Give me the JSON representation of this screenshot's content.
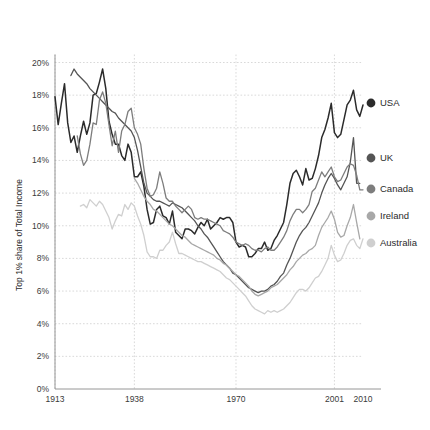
{
  "chart_data": {
    "type": "line",
    "title": "",
    "xlabel": "",
    "ylabel": "Top 1% share of Total Income",
    "xlim": [
      1913,
      2010
    ],
    "ylim": [
      0,
      20
    ],
    "grid": true,
    "legend_position": "right",
    "y_ticks": [
      "0%",
      "2%",
      "4%",
      "6%",
      "8%",
      "10%",
      "12%",
      "14%",
      "16%",
      "18%",
      "20%"
    ],
    "y_tick_values": [
      0,
      2,
      4,
      6,
      8,
      10,
      12,
      14,
      16,
      18,
      20
    ],
    "x_ticks": [
      "1913",
      "1938",
      "1970",
      "2001",
      "2010"
    ],
    "x_tick_values": [
      1913,
      1938,
      1970,
      2001,
      2010
    ],
    "x_gridlines": [
      1913,
      1938,
      1970,
      2001
    ],
    "colors": {
      "USA": "#2b2b2b",
      "UK": "#555555",
      "Canada": "#7d7d7d",
      "Ireland": "#a8a8a8",
      "Australia": "#cfcfcf"
    },
    "series": [
      {
        "name": "USA",
        "color": "#2b2b2b",
        "x": [
          1913,
          1914,
          1915,
          1916,
          1917,
          1918,
          1919,
          1920,
          1921,
          1922,
          1923,
          1924,
          1925,
          1926,
          1927,
          1928,
          1929,
          1930,
          1931,
          1932,
          1933,
          1934,
          1935,
          1936,
          1937,
          1938,
          1939,
          1940,
          1941,
          1942,
          1943,
          1944,
          1945,
          1946,
          1947,
          1948,
          1949,
          1950,
          1951,
          1952,
          1953,
          1954,
          1955,
          1956,
          1957,
          1958,
          1959,
          1960,
          1961,
          1962,
          1963,
          1964,
          1965,
          1966,
          1967,
          1968,
          1969,
          1970,
          1971,
          1972,
          1973,
          1974,
          1975,
          1976,
          1977,
          1978,
          1979,
          1980,
          1981,
          1982,
          1983,
          1984,
          1985,
          1986,
          1987,
          1988,
          1989,
          1990,
          1991,
          1992,
          1993,
          1994,
          1995,
          1996,
          1997,
          1998,
          1999,
          2000,
          2001,
          2002,
          2003,
          2004,
          2005,
          2006,
          2007,
          2008,
          2009,
          2010
        ],
        "y": [
          17.9,
          16.2,
          17.5,
          18.7,
          16.3,
          15.1,
          15.5,
          14.5,
          15.5,
          16.4,
          15.6,
          16.3,
          18.0,
          18.1,
          18.8,
          19.6,
          18.4,
          16.4,
          15.6,
          15.0,
          15.0,
          14.3,
          14.0,
          15.0,
          14.5,
          13.0,
          13.0,
          13.3,
          12.4,
          11.0,
          10.1,
          10.2,
          11.0,
          11.2,
          10.6,
          10.5,
          10.1,
          10.9,
          9.6,
          9.4,
          9.2,
          9.8,
          9.8,
          9.7,
          9.5,
          9.9,
          10.2,
          10.0,
          10.4,
          9.8,
          10.0,
          10.2,
          10.5,
          10.4,
          10.5,
          10.5,
          10.2,
          9.0,
          8.7,
          8.8,
          8.7,
          8.1,
          8.1,
          8.3,
          8.6,
          8.6,
          9.0,
          8.5,
          8.6,
          9.1,
          9.4,
          9.8,
          10.2,
          11.3,
          12.6,
          13.2,
          13.4,
          13.0,
          12.5,
          13.5,
          12.8,
          12.9,
          13.5,
          14.3,
          15.4,
          15.9,
          16.6,
          17.5,
          15.7,
          15.4,
          15.6,
          16.5,
          17.4,
          17.7,
          18.3,
          17.1,
          16.7,
          17.4
        ]
      },
      {
        "name": "UK",
        "color": "#555555",
        "x": [
          1918,
          1919,
          1920,
          1921,
          1922,
          1923,
          1924,
          1925,
          1926,
          1927,
          1928,
          1929,
          1930,
          1931,
          1932,
          1933,
          1934,
          1935,
          1936,
          1937,
          1938,
          1939,
          1940,
          1941,
          1942,
          1943,
          1944,
          1945,
          1946,
          1947,
          1948,
          1949,
          1950,
          1951,
          1952,
          1953,
          1954,
          1955,
          1956,
          1957,
          1958,
          1959,
          1960,
          1961,
          1962,
          1963,
          1964,
          1965,
          1966,
          1967,
          1968,
          1969,
          1970,
          1971,
          1972,
          1973,
          1974,
          1975,
          1976,
          1977,
          1978,
          1979,
          1980,
          1981,
          1982,
          1983,
          1984,
          1985,
          1986,
          1987,
          1988,
          1989,
          1990,
          1991,
          1992,
          1993,
          1994,
          1995,
          1996,
          1997,
          1998,
          1999,
          2000,
          2001,
          2002,
          2003,
          2004,
          2005,
          2006,
          2007,
          2008,
          2009
        ],
        "y": [
          19.2,
          19.6,
          19.3,
          19.1,
          18.9,
          18.7,
          18.4,
          18.2,
          18.0,
          17.8,
          17.6,
          17.4,
          17.2,
          17.0,
          16.9,
          16.6,
          16.4,
          16.2,
          16.0,
          15.8,
          15.4,
          14.6,
          13.6,
          12.6,
          12.0,
          11.8,
          11.6,
          11.5,
          11.5,
          11.4,
          11.3,
          11.2,
          11.4,
          11.3,
          11.2,
          11.1,
          10.9,
          10.7,
          10.5,
          10.3,
          10.0,
          9.8,
          9.5,
          9.3,
          9.0,
          8.7,
          8.4,
          8.1,
          7.8,
          7.6,
          7.4,
          7.1,
          7.0,
          6.8,
          6.6,
          6.4,
          6.2,
          6.1,
          6.0,
          5.9,
          6.0,
          6.0,
          6.1,
          6.3,
          6.4,
          6.6,
          6.9,
          7.1,
          7.6,
          8.0,
          8.5,
          9.0,
          9.4,
          9.7,
          9.9,
          10.2,
          10.6,
          11.0,
          11.4,
          12.0,
          12.5,
          12.9,
          13.2,
          12.9,
          12.5,
          12.2,
          12.6,
          13.0,
          13.9,
          15.4,
          12.6,
          12.6
        ]
      },
      {
        "name": "Canada",
        "color": "#7d7d7d",
        "x": [
          1920,
          1921,
          1922,
          1923,
          1924,
          1925,
          1926,
          1927,
          1928,
          1929,
          1930,
          1931,
          1932,
          1933,
          1934,
          1935,
          1936,
          1937,
          1938,
          1939,
          1940,
          1941,
          1942,
          1943,
          1944,
          1945,
          1946,
          1947,
          1948,
          1949,
          1950,
          1951,
          1952,
          1953,
          1954,
          1955,
          1956,
          1957,
          1958,
          1959,
          1960,
          1961,
          1962,
          1963,
          1964,
          1965,
          1966,
          1967,
          1968,
          1969,
          1970,
          1971,
          1972,
          1973,
          1974,
          1975,
          1976,
          1977,
          1978,
          1979,
          1980,
          1981,
          1982,
          1983,
          1984,
          1985,
          1986,
          1987,
          1988,
          1989,
          1990,
          1991,
          1992,
          1993,
          1994,
          1995,
          1996,
          1997,
          1998,
          1999,
          2000,
          2001,
          2002,
          2003,
          2004,
          2005,
          2006,
          2007,
          2008,
          2009,
          2010
        ],
        "y": [
          15.5,
          14.4,
          13.7,
          14.0,
          15.0,
          16.3,
          16.2,
          17.7,
          18.2,
          17.5,
          16.2,
          14.9,
          15.8,
          14.5,
          15.8,
          16.2,
          17.0,
          17.2,
          16.0,
          15.6,
          15.0,
          13.5,
          12.3,
          11.8,
          11.9,
          12.3,
          13.3,
          12.6,
          11.7,
          11.5,
          11.5,
          11.2,
          11.0,
          10.8,
          11.0,
          11.2,
          11.0,
          10.5,
          10.4,
          10.5,
          10.4,
          10.4,
          10.3,
          10.2,
          10.1,
          10.0,
          9.7,
          9.6,
          9.5,
          9.3,
          9.0,
          8.9,
          8.8,
          8.9,
          8.8,
          8.6,
          8.5,
          8.5,
          8.4,
          8.6,
          8.7,
          8.5,
          8.5,
          8.7,
          9.0,
          9.3,
          9.7,
          10.3,
          10.7,
          11.0,
          11.0,
          10.8,
          11.0,
          11.3,
          12.1,
          12.3,
          12.8,
          13.3,
          13.0,
          13.3,
          13.6,
          13.0,
          12.7,
          12.8,
          13.2,
          13.6,
          13.8,
          13.7,
          13.1,
          12.2,
          12.2
        ]
      },
      {
        "name": "Ireland",
        "color": "#a8a8a8",
        "x": [
          1938,
          1939,
          1940,
          1941,
          1942,
          1943,
          1944,
          1945,
          1946,
          1947,
          1948,
          1949,
          1950,
          1951,
          1952,
          1953,
          1954,
          1955,
          1956,
          1957,
          1958,
          1959,
          1960,
          1961,
          1962,
          1963,
          1964,
          1965,
          1966,
          1967,
          1968,
          1969,
          1970,
          1971,
          1972,
          1973,
          1974,
          1975,
          1976,
          1977,
          1978,
          1979,
          1980,
          1981,
          1982,
          1983,
          1984,
          1985,
          1986,
          1987,
          1988,
          1989,
          1990,
          1991,
          1992,
          1993,
          1994,
          1995,
          1996,
          1997,
          1998,
          1999,
          2000,
          2001,
          2002,
          2003,
          2004,
          2005,
          2006,
          2007,
          2008,
          2009
        ],
        "y": [
          12.9,
          12.6,
          12.2,
          11.8,
          11.5,
          11.3,
          11.0,
          10.9,
          10.7,
          10.5,
          10.3,
          10.1,
          10.0,
          9.8,
          9.6,
          9.4,
          9.3,
          9.1,
          8.9,
          8.8,
          8.7,
          8.6,
          8.5,
          8.4,
          8.3,
          8.2,
          8.0,
          7.9,
          7.7,
          7.6,
          7.4,
          7.2,
          7.0,
          6.9,
          6.7,
          6.5,
          6.3,
          6.0,
          5.8,
          5.7,
          5.8,
          5.9,
          6.0,
          6.2,
          6.3,
          6.4,
          6.6,
          6.8,
          7.0,
          7.3,
          7.5,
          7.8,
          8.0,
          8.2,
          8.3,
          8.5,
          8.6,
          8.8,
          9.4,
          9.9,
          10.2,
          10.5,
          10.9,
          10.4,
          9.6,
          9.3,
          9.4,
          10.0,
          10.5,
          11.3,
          10.2,
          9.2
        ]
      },
      {
        "name": "Australia",
        "color": "#cfcfcf",
        "x": [
          1921,
          1922,
          1923,
          1924,
          1925,
          1926,
          1927,
          1928,
          1929,
          1930,
          1931,
          1932,
          1933,
          1934,
          1935,
          1936,
          1937,
          1938,
          1939,
          1940,
          1941,
          1942,
          1943,
          1944,
          1945,
          1946,
          1947,
          1948,
          1949,
          1950,
          1951,
          1952,
          1953,
          1954,
          1955,
          1956,
          1957,
          1958,
          1959,
          1960,
          1961,
          1962,
          1963,
          1964,
          1965,
          1966,
          1967,
          1968,
          1969,
          1970,
          1971,
          1972,
          1973,
          1974,
          1975,
          1976,
          1977,
          1978,
          1979,
          1980,
          1981,
          1982,
          1983,
          1984,
          1985,
          1986,
          1987,
          1988,
          1989,
          1990,
          1991,
          1992,
          1993,
          1994,
          1995,
          1996,
          1997,
          1998,
          1999,
          2000,
          2001,
          2002,
          2003,
          2004,
          2005,
          2006,
          2007,
          2008,
          2009,
          2010
        ],
        "y": [
          11.2,
          11.3,
          11.1,
          11.6,
          11.4,
          11.2,
          11.5,
          11.3,
          10.9,
          10.5,
          9.8,
          10.3,
          10.7,
          10.6,
          11.3,
          11.0,
          11.4,
          11.2,
          10.6,
          10.1,
          9.4,
          8.4,
          8.1,
          8.1,
          8.0,
          8.5,
          8.5,
          8.8,
          9.0,
          9.6,
          8.9,
          8.3,
          8.3,
          8.2,
          8.1,
          8.0,
          7.9,
          7.8,
          7.8,
          7.7,
          7.6,
          7.5,
          7.4,
          7.3,
          7.2,
          7.0,
          6.8,
          6.7,
          6.5,
          6.3,
          6.1,
          5.9,
          5.7,
          5.4,
          5.1,
          4.9,
          4.8,
          4.7,
          4.6,
          4.8,
          4.7,
          4.8,
          4.7,
          4.8,
          4.9,
          5.1,
          5.3,
          5.6,
          5.9,
          6.1,
          6.1,
          6.0,
          6.2,
          6.5,
          6.8,
          6.9,
          7.2,
          7.6,
          8.0,
          8.8,
          8.2,
          7.8,
          7.9,
          8.3,
          8.8,
          9.1,
          9.2,
          8.8,
          8.6,
          9.2
        ]
      }
    ]
  },
  "legend": {
    "items": [
      {
        "label": "USA",
        "color": "#2b2b2b",
        "y": 103
      },
      {
        "label": "UK",
        "color": "#555555",
        "y": 158
      },
      {
        "label": "Canada",
        "color": "#7d7d7d",
        "y": 189
      },
      {
        "label": "Ireland",
        "color": "#a8a8a8",
        "y": 216
      },
      {
        "label": "Australia",
        "color": "#cfcfcf",
        "y": 243
      }
    ]
  },
  "axes": {
    "y_title": "Top 1% share of Total Income"
  }
}
